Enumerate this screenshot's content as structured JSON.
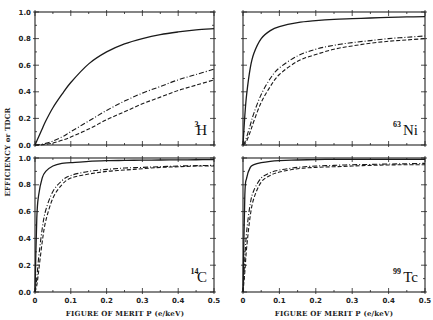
{
  "chart_data": {
    "type": "line",
    "layout": "2x2 panels",
    "ylabel": "EFFICIENCY or TDCR",
    "xlabel": "FIGURE OF MERIT P (e/keV)",
    "xlim": [
      0,
      0.5
    ],
    "ylim": [
      0,
      1.0
    ],
    "x_ticks": [
      "0",
      "0.1",
      "0.2",
      "0.3",
      "0.4",
      "0.5"
    ],
    "y_ticks": [
      "0.0",
      "0.2",
      "0.4",
      "0.6",
      "0.8",
      "1.0"
    ],
    "grid": false,
    "legend": "none",
    "series_styles": [
      {
        "name": "solid",
        "dash": ""
      },
      {
        "name": "dash-dot",
        "dash": "5,2,1,2"
      },
      {
        "name": "dashed",
        "dash": "4,2"
      }
    ],
    "x": [
      0,
      0.005,
      0.01,
      0.02,
      0.03,
      0.05,
      0.075,
      0.1,
      0.15,
      0.2,
      0.25,
      0.3,
      0.35,
      0.4,
      0.45,
      0.5
    ],
    "panels": [
      {
        "isotope_mass": "3",
        "isotope_symbol": "H",
        "series": [
          {
            "name": "solid",
            "values": [
              0,
              0.03,
              0.06,
              0.12,
              0.18,
              0.28,
              0.38,
              0.47,
              0.61,
              0.7,
              0.76,
              0.8,
              0.83,
              0.85,
              0.865,
              0.875
            ]
          },
          {
            "name": "dash-dot",
            "values": [
              0,
              0.0,
              0.002,
              0.006,
              0.012,
              0.03,
              0.06,
              0.1,
              0.18,
              0.26,
              0.33,
              0.39,
              0.44,
              0.49,
              0.53,
              0.57
            ]
          },
          {
            "name": "dashed",
            "values": [
              0,
              0.0,
              0.0,
              0.002,
              0.005,
              0.015,
              0.035,
              0.06,
              0.12,
              0.19,
              0.25,
              0.31,
              0.36,
              0.41,
              0.45,
              0.49
            ]
          }
        ]
      },
      {
        "isotope_mass": "63",
        "isotope_symbol": "Ni",
        "series": [
          {
            "name": "solid",
            "values": [
              0,
              0.22,
              0.38,
              0.58,
              0.69,
              0.8,
              0.86,
              0.89,
              0.92,
              0.935,
              0.945,
              0.95,
              0.955,
              0.96,
              0.963,
              0.965
            ]
          },
          {
            "name": "dash-dot",
            "values": [
              0,
              0.02,
              0.06,
              0.15,
              0.24,
              0.38,
              0.5,
              0.58,
              0.67,
              0.72,
              0.75,
              0.77,
              0.785,
              0.8,
              0.81,
              0.82
            ]
          },
          {
            "name": "dashed",
            "values": [
              0,
              0.01,
              0.03,
              0.1,
              0.18,
              0.32,
              0.44,
              0.53,
              0.63,
              0.68,
              0.72,
              0.745,
              0.765,
              0.78,
              0.79,
              0.8
            ]
          }
        ]
      },
      {
        "isotope_mass": "14",
        "isotope_symbol": "C",
        "series": [
          {
            "name": "solid",
            "values": [
              0,
              0.55,
              0.72,
              0.85,
              0.9,
              0.94,
              0.96,
              0.965,
              0.975,
              0.98,
              0.982,
              0.984,
              0.985,
              0.986,
              0.987,
              0.988
            ]
          },
          {
            "name": "dash-dot",
            "values": [
              0,
              0.1,
              0.25,
              0.47,
              0.61,
              0.75,
              0.83,
              0.87,
              0.9,
              0.915,
              0.925,
              0.93,
              0.935,
              0.94,
              0.943,
              0.945
            ]
          },
          {
            "name": "dashed",
            "values": [
              0,
              0.05,
              0.15,
              0.37,
              0.53,
              0.7,
              0.8,
              0.85,
              0.88,
              0.9,
              0.91,
              0.92,
              0.93,
              0.935,
              0.94,
              0.94
            ]
          }
        ]
      },
      {
        "isotope_mass": "99",
        "isotope_symbol": "Tc",
        "series": [
          {
            "name": "solid",
            "values": [
              0,
              0.72,
              0.85,
              0.93,
              0.95,
              0.965,
              0.975,
              0.98,
              0.985,
              0.988,
              0.99,
              0.99,
              0.99,
              0.99,
              0.99,
              0.99
            ]
          },
          {
            "name": "dash-dot",
            "values": [
              0,
              0.25,
              0.45,
              0.66,
              0.76,
              0.85,
              0.89,
              0.91,
              0.93,
              0.94,
              0.945,
              0.95,
              0.952,
              0.955,
              0.957,
              0.96
            ]
          },
          {
            "name": "dashed",
            "values": [
              0,
              0.15,
              0.33,
              0.57,
              0.7,
              0.82,
              0.87,
              0.895,
              0.92,
              0.93,
              0.935,
              0.94,
              0.945,
              0.948,
              0.95,
              0.95
            ]
          }
        ]
      }
    ]
  }
}
